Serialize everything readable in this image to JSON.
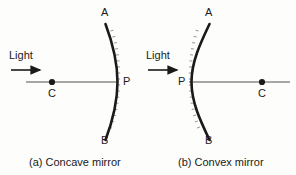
{
  "figure": {
    "type": "physics-optics-diagram",
    "background_color": "#fdfdfb",
    "stroke_color": "#1a1a1a",
    "axis_color": "#8a8a8a",
    "panels": [
      {
        "id": "a",
        "caption": "(a) Concave mirror",
        "light_label": "Light",
        "mirror_top_label": "A",
        "mirror_bottom_label": "B",
        "pole_label": "P",
        "center_label": "C",
        "mirror_bulge": "right",
        "reflecting_side": "left",
        "hatching_side": "right"
      },
      {
        "id": "b",
        "caption": "(b) Convex mirror",
        "light_label": "Light",
        "mirror_top_label": "A",
        "mirror_bottom_label": "B",
        "pole_label": "P",
        "center_label": "C",
        "mirror_bulge": "left",
        "reflecting_side": "left",
        "hatching_side": "left"
      }
    ]
  }
}
